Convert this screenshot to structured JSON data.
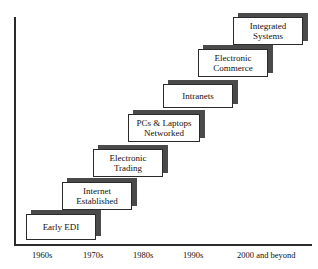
{
  "figure": {
    "title_remnant": "",
    "axis": {
      "x_labels": [
        "1960s",
        "1970s",
        "1980s",
        "1990s",
        "2000 and beyond"
      ]
    }
  },
  "chart_data": {
    "type": "bar",
    "title": "",
    "subtitle": "",
    "xlabel": "",
    "ylabel": "",
    "grid": false,
    "legend": "none",
    "categories": [
      "1960s",
      "1970s",
      "1980s",
      "1990s",
      "2000 and beyond"
    ],
    "steps": [
      {
        "index": 1,
        "label": "Early EDI",
        "lines": [
          "Early EDI"
        ],
        "era": "1960s",
        "level": 1,
        "x": 26,
        "y": 214,
        "w": 70,
        "h": 26
      },
      {
        "index": 2,
        "label": "Internet Established",
        "lines": [
          "Internet",
          "Established"
        ],
        "era": "1970s",
        "level": 2,
        "x": 62,
        "y": 182,
        "w": 70,
        "h": 28
      },
      {
        "index": 3,
        "label": "Electronic Trading",
        "lines": [
          "Electronic",
          "Trading"
        ],
        "era": "1980s",
        "level": 3,
        "x": 93,
        "y": 149,
        "w": 70,
        "h": 28
      },
      {
        "index": 4,
        "label": "PCs & Laptops Networked",
        "lines": [
          "PCs & Laptops",
          "Networked"
        ],
        "era": "1980s-1990s",
        "level": 4,
        "x": 128,
        "y": 114,
        "w": 72,
        "h": 28
      },
      {
        "index": 5,
        "label": "Intranets",
        "lines": [
          "Intranets"
        ],
        "era": "1990s",
        "level": 5,
        "x": 163,
        "y": 84,
        "w": 70,
        "h": 24
      },
      {
        "index": 6,
        "label": "Electronic Commerce",
        "lines": [
          "Electronic",
          "Commerce"
        ],
        "era": "1990s-2000s",
        "level": 6,
        "x": 198,
        "y": 49,
        "w": 70,
        "h": 28
      },
      {
        "index": 7,
        "label": "Integrated Systems",
        "lines": [
          "Integrated",
          "Systems"
        ],
        "era": "2000 and beyond",
        "level": 7,
        "x": 233,
        "y": 17,
        "w": 70,
        "h": 28
      }
    ],
    "x_tick_positions": [
      32,
      83,
      133,
      183,
      237
    ]
  },
  "colors": {
    "box_fill": "#ffffff",
    "box_border": "#2b2b2b",
    "shadow": "#4a4a4a",
    "axis": "#2b2b2b",
    "text": "#111111",
    "background": "#ffffff"
  }
}
